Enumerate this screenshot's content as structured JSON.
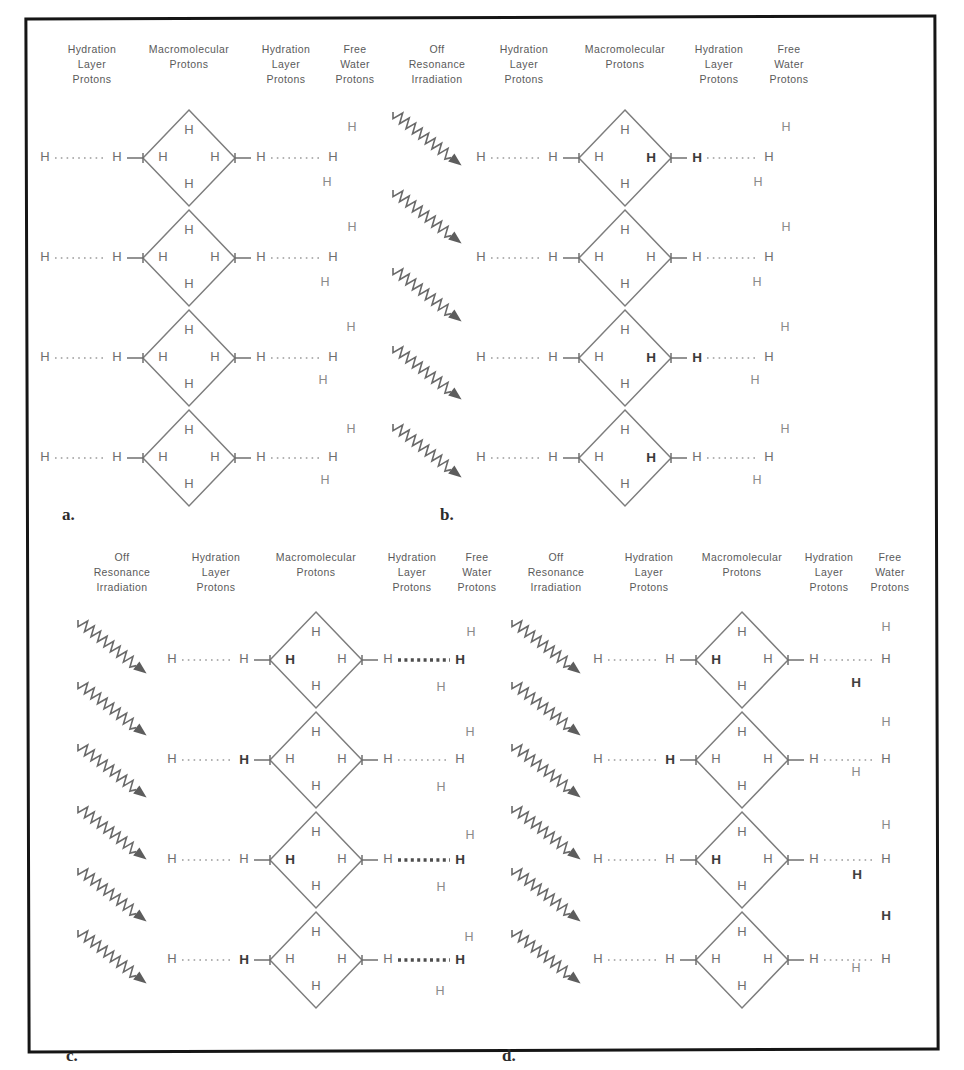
{
  "figure": {
    "border_color": "#151515",
    "background": "#ffffff",
    "ink_color": "#6e6e6e",
    "bold_ink_color": "#3a3a3a"
  },
  "column_headers": {
    "off_resonance": "Off\nResonance\nIrradiation",
    "off_resonance_lines": [
      "Off",
      "Resonance",
      "Irradiation"
    ],
    "hydration_layer": "Hydration\nLayer\nProtons",
    "hydration_layer_lines": [
      "Hydration",
      "Layer",
      "Protons"
    ],
    "macromolecular": "Macromolecular\nProtons",
    "macromolecular_lines": [
      "Macromolecular",
      "Protons"
    ],
    "free_water": "Free\nWater\nProtons",
    "free_water_lines": [
      "Free",
      "Water",
      "Protons"
    ]
  },
  "atom_label": "H",
  "panels": [
    {
      "id": "a",
      "label": "a.",
      "has_irradiation": false,
      "headers": [
        {
          "key": "hydration_layer",
          "x": 92
        },
        {
          "key": "macromolecular",
          "x": 189
        },
        {
          "key": "hydration_layer",
          "x": 286
        },
        {
          "key": "free_water",
          "x": 355
        }
      ],
      "rows": [
        {
          "outer_left_bold": false,
          "inner_left_bold": false,
          "mac_left_bold": false,
          "mac_right_bold": false,
          "inner_right_bold": false,
          "outer_right_bold": false,
          "right_dot_bold": false,
          "left_dot_bold": false
        },
        {
          "outer_left_bold": false,
          "inner_left_bold": false,
          "mac_left_bold": false,
          "mac_right_bold": false,
          "inner_right_bold": false,
          "outer_right_bold": false,
          "right_dot_bold": false,
          "left_dot_bold": false
        },
        {
          "outer_left_bold": false,
          "inner_left_bold": false,
          "mac_left_bold": false,
          "mac_right_bold": false,
          "inner_right_bold": false,
          "outer_right_bold": false,
          "right_dot_bold": false,
          "left_dot_bold": false
        },
        {
          "outer_left_bold": false,
          "inner_left_bold": false,
          "mac_left_bold": false,
          "mac_right_bold": false,
          "inner_right_bold": false,
          "outer_right_bold": false,
          "right_dot_bold": false,
          "left_dot_bold": false
        }
      ],
      "water_protons": [
        {
          "x": 352,
          "y": 128,
          "bold": false
        },
        {
          "x": 327,
          "y": 183,
          "bold": false
        },
        {
          "x": 352,
          "y": 228,
          "bold": false
        },
        {
          "x": 325,
          "y": 283,
          "bold": false
        },
        {
          "x": 351,
          "y": 328,
          "bold": false
        },
        {
          "x": 323,
          "y": 381,
          "bold": false
        },
        {
          "x": 351,
          "y": 430,
          "bold": false
        },
        {
          "x": 325,
          "y": 481,
          "bold": false
        }
      ]
    },
    {
      "id": "b",
      "label": "b.",
      "has_irradiation": true,
      "headers": [
        {
          "key": "off_resonance",
          "x": 437
        },
        {
          "key": "hydration_layer",
          "x": 524
        },
        {
          "key": "macromolecular",
          "x": 625
        },
        {
          "key": "hydration_layer",
          "x": 719
        },
        {
          "key": "free_water",
          "x": 789
        }
      ],
      "rows": [
        {
          "outer_left_bold": false,
          "inner_left_bold": false,
          "mac_left_bold": false,
          "mac_right_bold": true,
          "inner_right_bold": true,
          "outer_right_bold": false,
          "right_dot_bold": false,
          "left_dot_bold": false
        },
        {
          "outer_left_bold": false,
          "inner_left_bold": false,
          "mac_left_bold": false,
          "mac_right_bold": false,
          "inner_right_bold": false,
          "outer_right_bold": false,
          "right_dot_bold": false,
          "left_dot_bold": false
        },
        {
          "outer_left_bold": false,
          "inner_left_bold": false,
          "mac_left_bold": false,
          "mac_right_bold": true,
          "inner_right_bold": true,
          "outer_right_bold": false,
          "right_dot_bold": false,
          "left_dot_bold": false
        },
        {
          "outer_left_bold": false,
          "inner_left_bold": false,
          "mac_left_bold": false,
          "mac_right_bold": true,
          "inner_right_bold": false,
          "outer_right_bold": false,
          "right_dot_bold": false,
          "left_dot_bold": false
        }
      ],
      "water_protons": [
        {
          "x": 786,
          "y": 128,
          "bold": false
        },
        {
          "x": 758,
          "y": 183,
          "bold": false
        },
        {
          "x": 786,
          "y": 228,
          "bold": false
        },
        {
          "x": 757,
          "y": 283,
          "bold": false
        },
        {
          "x": 785,
          "y": 328,
          "bold": false
        },
        {
          "x": 755,
          "y": 381,
          "bold": false
        },
        {
          "x": 785,
          "y": 430,
          "bold": false
        },
        {
          "x": 757,
          "y": 481,
          "bold": false
        }
      ]
    },
    {
      "id": "c",
      "label": "c.",
      "has_irradiation": true,
      "headers": [
        {
          "key": "off_resonance",
          "x": 122
        },
        {
          "key": "hydration_layer",
          "x": 216
        },
        {
          "key": "macromolecular",
          "x": 316
        },
        {
          "key": "hydration_layer",
          "x": 412
        },
        {
          "key": "free_water",
          "x": 477
        }
      ],
      "rows": [
        {
          "outer_left_bold": false,
          "inner_left_bold": false,
          "mac_left_bold": true,
          "mac_right_bold": false,
          "inner_right_bold": false,
          "outer_right_bold": true,
          "right_dot_bold": true,
          "left_dot_bold": false
        },
        {
          "outer_left_bold": false,
          "inner_left_bold": true,
          "mac_left_bold": false,
          "mac_right_bold": false,
          "inner_right_bold": false,
          "outer_right_bold": false,
          "right_dot_bold": false,
          "left_dot_bold": false
        },
        {
          "outer_left_bold": false,
          "inner_left_bold": false,
          "mac_left_bold": true,
          "mac_right_bold": false,
          "inner_right_bold": false,
          "outer_right_bold": true,
          "right_dot_bold": true,
          "left_dot_bold": false
        },
        {
          "outer_left_bold": false,
          "inner_left_bold": true,
          "mac_left_bold": false,
          "mac_right_bold": false,
          "inner_right_bold": false,
          "outer_right_bold": true,
          "right_dot_bold": true,
          "left_dot_bold": false
        }
      ],
      "water_protons": [
        {
          "x": 471,
          "y": 633,
          "bold": false
        },
        {
          "x": 441,
          "y": 688,
          "bold": false
        },
        {
          "x": 470,
          "y": 733,
          "bold": false
        },
        {
          "x": 441,
          "y": 788,
          "bold": false
        },
        {
          "x": 470,
          "y": 836,
          "bold": false
        },
        {
          "x": 441,
          "y": 888,
          "bold": false
        },
        {
          "x": 469,
          "y": 938,
          "bold": false
        },
        {
          "x": 440,
          "y": 992,
          "bold": false
        }
      ]
    },
    {
      "id": "d",
      "label": "d.",
      "has_irradiation": true,
      "headers": [
        {
          "key": "off_resonance",
          "x": 556
        },
        {
          "key": "hydration_layer",
          "x": 649
        },
        {
          "key": "macromolecular",
          "x": 742
        },
        {
          "key": "hydration_layer",
          "x": 829
        },
        {
          "key": "free_water",
          "x": 890
        }
      ],
      "rows": [
        {
          "outer_left_bold": false,
          "inner_left_bold": false,
          "mac_left_bold": true,
          "mac_right_bold": false,
          "inner_right_bold": false,
          "outer_right_bold": false,
          "right_dot_bold": false,
          "left_dot_bold": false
        },
        {
          "outer_left_bold": false,
          "inner_left_bold": true,
          "mac_left_bold": false,
          "mac_right_bold": false,
          "inner_right_bold": false,
          "outer_right_bold": false,
          "right_dot_bold": false,
          "left_dot_bold": false
        },
        {
          "outer_left_bold": false,
          "inner_left_bold": false,
          "mac_left_bold": true,
          "mac_right_bold": false,
          "inner_right_bold": false,
          "outer_right_bold": false,
          "right_dot_bold": false,
          "left_dot_bold": false
        },
        {
          "outer_left_bold": false,
          "inner_left_bold": false,
          "mac_left_bold": false,
          "mac_right_bold": false,
          "inner_right_bold": false,
          "outer_right_bold": false,
          "right_dot_bold": false,
          "left_dot_bold": false
        }
      ],
      "water_protons": [
        {
          "x": 886,
          "y": 628,
          "bold": false
        },
        {
          "x": 856,
          "y": 683,
          "bold": true
        },
        {
          "x": 886,
          "y": 723,
          "bold": false
        },
        {
          "x": 856,
          "y": 773,
          "bold": false
        },
        {
          "x": 886,
          "y": 826,
          "bold": false
        },
        {
          "x": 857,
          "y": 875,
          "bold": true
        },
        {
          "x": 886,
          "y": 916,
          "bold": true
        },
        {
          "x": 856,
          "y": 969,
          "bold": false
        }
      ]
    }
  ],
  "geometry": {
    "diamond_half_width": 46,
    "diamond_half_height": 48,
    "row_spacing": 100,
    "top_panels_y": 110,
    "bottom_panels_y": 612
  }
}
